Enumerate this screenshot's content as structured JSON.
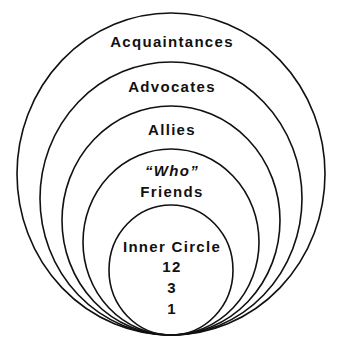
{
  "diagram": {
    "type": "nested-circles",
    "line_color": "#111111",
    "background": "#ffffff",
    "rings": [
      {
        "id": "acquaintances",
        "label": "Acquaintances"
      },
      {
        "id": "advocates",
        "label": "Advocates"
      },
      {
        "id": "allies",
        "label": "Allies"
      },
      {
        "id": "who-friends",
        "label_line1": "“Who”",
        "label_line2": "Friends"
      },
      {
        "id": "inner-circle",
        "label": "Inner Circle",
        "numbers": [
          "12",
          "3",
          "1"
        ]
      }
    ]
  }
}
